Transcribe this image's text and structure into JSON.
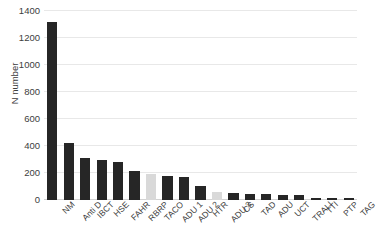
{
  "chart_data": {
    "type": "bar",
    "title": "",
    "xlabel": "",
    "ylabel": "N number",
    "ylim": [
      0,
      1400
    ],
    "ytick_step": 200,
    "yticks": [
      0,
      200,
      400,
      600,
      800,
      1000,
      1200,
      1400
    ],
    "grid": "horizontal",
    "legend": "none",
    "categories": [
      "NM",
      "Anti D",
      "IBCT",
      "HSE",
      "FAHR",
      "RBRP",
      "TACO",
      "ADU 1",
      "ADU 2",
      "HTR",
      "ADU 3",
      "CS",
      "TAD",
      "ADU",
      "UCT",
      "TRALI",
      "TTI",
      "PTP",
      "TAG"
    ],
    "values": [
      1320,
      420,
      310,
      295,
      280,
      215,
      195,
      180,
      170,
      105,
      60,
      52,
      45,
      42,
      40,
      38,
      16,
      14,
      13
    ],
    "bar_colors": [
      "#262626",
      "#262626",
      "#262626",
      "#262626",
      "#262626",
      "#262626",
      "#d9d9d9",
      "#262626",
      "#262626",
      "#262626",
      "#d9d9d9",
      "#262626",
      "#262626",
      "#262626",
      "#262626",
      "#262626",
      "#262626",
      "#262626",
      "#262626"
    ],
    "colors": {
      "bar_dark": "#262626",
      "bar_light": "#d9d9d9",
      "gridline": "#e8e8e8",
      "axis": "#d2d2d2",
      "text": "#3c3c3c",
      "background": "#ffffff"
    }
  }
}
